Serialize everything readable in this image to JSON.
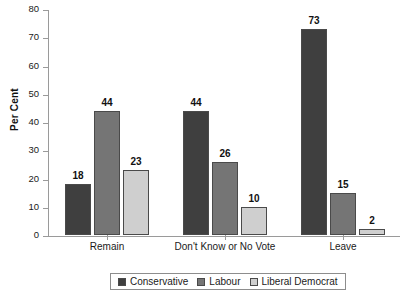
{
  "chart_data": {
    "type": "bar",
    "title": "",
    "xlabel": "",
    "ylabel": "Per Cent",
    "ylim": [
      0,
      80
    ],
    "ytick_step": 10,
    "yticks": [
      80,
      70,
      60,
      50,
      40,
      30,
      20,
      10,
      0
    ],
    "grid": false,
    "legend_position": "bottom-center",
    "categories": [
      "Remain",
      "Don't Know or No Vote",
      "Leave"
    ],
    "series": [
      {
        "name": "Conservative",
        "color": "#3f3f3f",
        "values": [
          18,
          44,
          73
        ]
      },
      {
        "name": "Labour",
        "color": "#757575",
        "values": [
          44,
          26,
          15
        ]
      },
      {
        "name": "Liberal Democrat",
        "color": "#cfcfcf",
        "values": [
          23,
          10,
          2
        ]
      }
    ]
  },
  "axis": {
    "y_label": "Per Cent"
  },
  "legend": {
    "items": [
      {
        "label": "Conservative"
      },
      {
        "label": "Labour"
      },
      {
        "label": "Liberal Democrat"
      }
    ]
  }
}
